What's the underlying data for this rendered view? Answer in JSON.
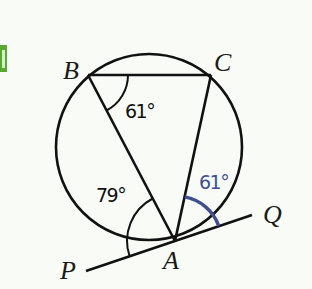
{
  "diagram": {
    "type": "circle-geometry",
    "marker": {
      "color": "#5aa832"
    },
    "colors": {
      "background": "#f8fbf6",
      "stroke": "#111111",
      "highlight": "#3f4f8f"
    },
    "circle": {
      "cx": 149,
      "cy": 147,
      "r": 93
    },
    "points": [
      {
        "id": "B",
        "label": "B",
        "x": 88,
        "y": 75
      },
      {
        "id": "C",
        "label": "C",
        "x": 211,
        "y": 75
      },
      {
        "id": "A",
        "label": "A",
        "x": 175,
        "y": 241
      },
      {
        "id": "P",
        "label": "P",
        "x": 86,
        "y": 271
      },
      {
        "id": "Q",
        "label": "Q",
        "x": 252,
        "y": 215
      }
    ],
    "segments": [
      "BC",
      "BA",
      "CA",
      "PQ"
    ],
    "angles": [
      {
        "at": "B",
        "between": "CBA",
        "label": "61°",
        "color": "#111111"
      },
      {
        "at": "A",
        "between": "PAB",
        "label": "79°",
        "color": "#111111"
      },
      {
        "at": "A",
        "between": "CAQ",
        "label": "61°",
        "color": "#3f4f8f"
      }
    ]
  }
}
